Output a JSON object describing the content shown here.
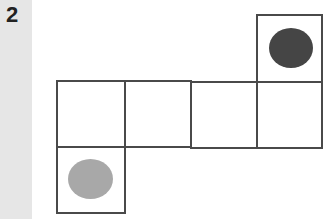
{
  "label": "2",
  "colors": {
    "sidebar": "#e6e6e6",
    "border": "#4a4a4a",
    "dark_dot": "#454545",
    "light_dot": "#a8a8a8"
  },
  "cells": [
    {
      "id": "top",
      "x": 256,
      "y": 14,
      "w": 67,
      "h": 69
    },
    {
      "id": "row-1",
      "x": 56,
      "y": 80,
      "w": 70,
      "h": 68
    },
    {
      "id": "row-2",
      "x": 124,
      "y": 80,
      "w": 68,
      "h": 68
    },
    {
      "id": "row-3",
      "x": 190,
      "y": 81,
      "w": 68,
      "h": 68
    },
    {
      "id": "row-4",
      "x": 256,
      "y": 81,
      "w": 67,
      "h": 68
    },
    {
      "id": "bottom",
      "x": 56,
      "y": 146,
      "w": 70,
      "h": 68
    }
  ],
  "dots": [
    {
      "id": "dark",
      "cell": "top",
      "color": "dark"
    },
    {
      "id": "light",
      "cell": "bottom",
      "color": "light"
    }
  ]
}
